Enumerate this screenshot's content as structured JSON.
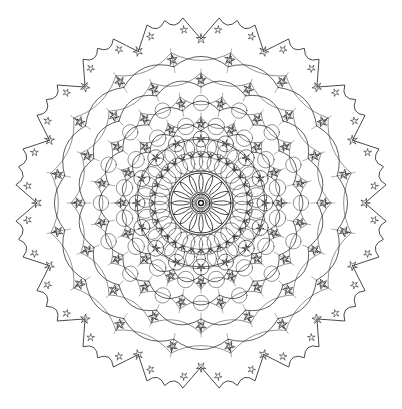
{
  "image": {
    "description": "Radially symmetric line-art mandala pattern of lobed rings, star-shaped nodes and interlocking circles",
    "background": "#ffffff",
    "stroke_color": "#1a1a1a",
    "center": [
      201,
      203
    ],
    "symmetry": 16
  },
  "layers": [
    {
      "name": "center-dot",
      "r": 2.5
    },
    {
      "name": "inner-ring",
      "r": 9
    },
    {
      "name": "petal-ring",
      "r_inner": 11,
      "r_outer": 30,
      "count": 16
    },
    {
      "name": "inner-circle-ring",
      "r": 32
    },
    {
      "name": "dense-circle-band",
      "r": 42,
      "circle_r": 11,
      "count": 32
    },
    {
      "name": "dense-circle-band-2",
      "r": 56,
      "circle_r": 10,
      "count": 32
    },
    {
      "name": "web-ring-1",
      "r": 75,
      "count": 16
    },
    {
      "name": "web-ring-2",
      "r": 105,
      "count": 16
    },
    {
      "name": "web-ring-3",
      "r": 138,
      "count": 16
    },
    {
      "name": "outer-lobes",
      "r": 172,
      "lobe_r": 22,
      "count": 16
    }
  ]
}
